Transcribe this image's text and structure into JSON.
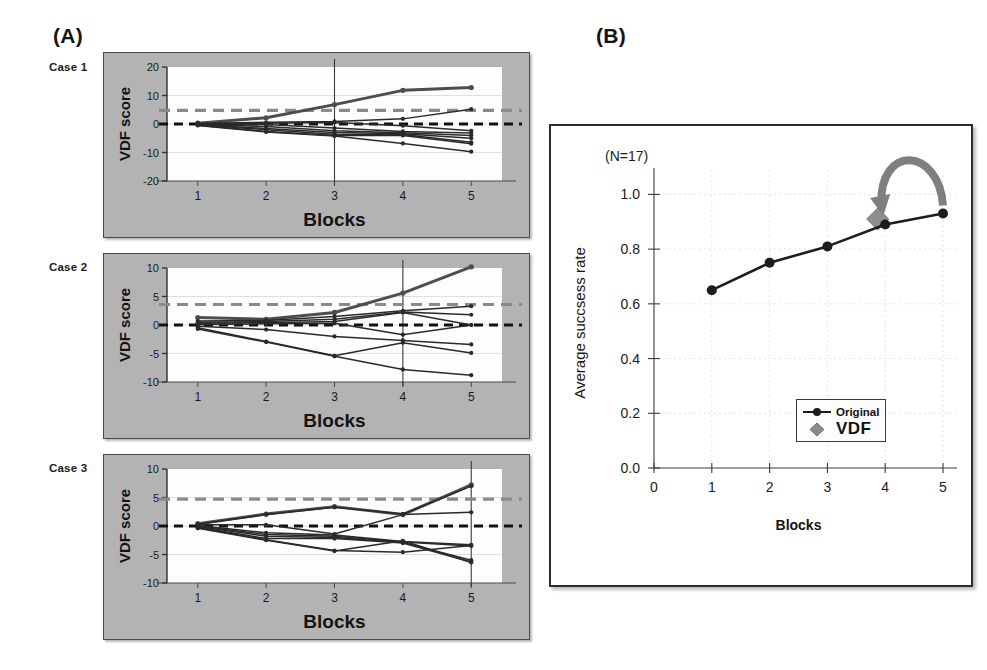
{
  "figure": {
    "panelA_letter": "(A)",
    "panelB_letter": "(B)"
  },
  "panelA": {
    "cases": [
      {
        "label": "Case 1",
        "ylabel": "VDF score",
        "xlabel": "Blocks",
        "yticks": [
          "20",
          "10",
          "0",
          "-10",
          "-20"
        ],
        "xticks": [
          "1",
          "2",
          "3",
          "4",
          "5"
        ]
      },
      {
        "label": "Case 2",
        "ylabel": "VDF score",
        "xlabel": "Blocks",
        "yticks": [
          "10",
          "5",
          "0",
          "-5",
          "-10"
        ],
        "xticks": [
          "1",
          "2",
          "3",
          "4",
          "5"
        ]
      },
      {
        "label": "Case 3",
        "ylabel": "VDF score",
        "xlabel": "Blocks",
        "yticks": [
          "10",
          "5",
          "0",
          "-5",
          "-10"
        ],
        "xticks": [
          "1",
          "2",
          "3",
          "4",
          "5"
        ]
      }
    ]
  },
  "panelB": {
    "annotation": "(N=17)",
    "ylabel": "Average succsess rate",
    "xlabel": "Blocks",
    "yticks": [
      "1.0",
      "0.8",
      "0.6",
      "0.4",
      "0.2",
      "0.0"
    ],
    "xticks": [
      "0",
      "1",
      "2",
      "3",
      "4",
      "5"
    ],
    "legend": [
      {
        "label": "Original",
        "marker": "line-circle-marker",
        "color": "#1d1d1d"
      },
      {
        "label": "VDF",
        "marker": "diamond-marker",
        "color": "#8a8a8a"
      }
    ],
    "arrow_name": "curved-transfer-arrow"
  },
  "colors": {
    "panel_bg_gray": "#b3b3b3",
    "plot_bg": "#ffffff",
    "line_dark": "#1d1d1d",
    "threshold_dashed_gray": "#8a8a8a",
    "zero_dashed_black": "#111111",
    "vdf_diamond_gray": "#8a8a8a",
    "arrow_gray": "#7f7f7f"
  },
  "chart_data": [
    {
      "id": "case1",
      "type": "line",
      "title": "Case 1",
      "xlabel": "Blocks",
      "ylabel": "VDF score",
      "x": [
        1,
        2,
        3,
        4,
        5
      ],
      "xlim": [
        0.55,
        5.45
      ],
      "ylim": [
        -20,
        20
      ],
      "yticks": [
        20,
        10,
        0,
        -10,
        -20
      ],
      "grid": true,
      "threshold_line": 4.8,
      "zero_line": 0,
      "marker_block": 3,
      "series": [
        {
          "name": "s1",
          "values": [
            0.3,
            2.2,
            6.8,
            11.8,
            12.8
          ]
        },
        {
          "name": "s2",
          "values": [
            0.2,
            0.6,
            0.9,
            1.8,
            5.2
          ]
        },
        {
          "name": "s3",
          "values": [
            0.1,
            0.3,
            0.5,
            -0.6,
            -2.4
          ]
        },
        {
          "name": "s4",
          "values": [
            0.0,
            -0.2,
            -1.4,
            -2.6,
            -3.2
          ]
        },
        {
          "name": "s5",
          "values": [
            -0.1,
            -0.9,
            -2.4,
            -3.1,
            -4.0
          ]
        },
        {
          "name": "s6",
          "values": [
            -0.2,
            -1.6,
            -3.0,
            -3.4,
            -5.0
          ]
        },
        {
          "name": "s7",
          "values": [
            -0.3,
            -2.0,
            -3.6,
            -3.7,
            -6.4
          ]
        },
        {
          "name": "s8",
          "values": [
            -0.4,
            -2.6,
            -4.0,
            -4.0,
            -6.9
          ]
        },
        {
          "name": "s9",
          "values": [
            -0.5,
            -2.8,
            -4.2,
            -6.8,
            -9.7
          ]
        }
      ]
    },
    {
      "id": "case2",
      "type": "line",
      "title": "Case 2",
      "xlabel": "Blocks",
      "ylabel": "VDF score",
      "x": [
        1,
        2,
        3,
        4,
        5
      ],
      "xlim": [
        0.55,
        5.45
      ],
      "ylim": [
        -10,
        10
      ],
      "yticks": [
        10,
        5,
        0,
        -5,
        -10
      ],
      "grid": true,
      "threshold_line": 3.6,
      "zero_line": 0,
      "marker_block": 4,
      "series": [
        {
          "name": "s1",
          "values": [
            1.3,
            1.0,
            2.2,
            5.6,
            10.2
          ]
        },
        {
          "name": "s2",
          "values": [
            0.7,
            0.8,
            1.5,
            2.5,
            3.3
          ]
        },
        {
          "name": "s3",
          "values": [
            0.5,
            0.6,
            1.0,
            2.3,
            1.8
          ]
        },
        {
          "name": "s4",
          "values": [
            0.3,
            0.4,
            0.6,
            2.2,
            0.0
          ]
        },
        {
          "name": "s5",
          "values": [
            0.1,
            0.2,
            0.3,
            -1.7,
            0.0
          ]
        },
        {
          "name": "s6",
          "values": [
            -0.2,
            -0.8,
            -2.0,
            -2.7,
            -3.4
          ]
        },
        {
          "name": "s7",
          "values": [
            -0.5,
            -2.9,
            -5.4,
            -3.1,
            -4.9
          ]
        },
        {
          "name": "s8",
          "values": [
            -0.7,
            -3.0,
            -5.5,
            -7.8,
            -8.8
          ]
        }
      ]
    },
    {
      "id": "case3",
      "type": "line",
      "title": "Case 3",
      "xlabel": "Blocks",
      "ylabel": "VDF score",
      "x": [
        1,
        2,
        3,
        4,
        5
      ],
      "xlim": [
        0.55,
        5.45
      ],
      "ylim": [
        -10,
        10
      ],
      "yticks": [
        10,
        5,
        0,
        -5,
        -10
      ],
      "grid": true,
      "threshold_line": 4.7,
      "zero_line": 0,
      "marker_block": 5,
      "series": [
        {
          "name": "s1",
          "values": [
            0.4,
            2.1,
            3.4,
            2.0,
            7.2
          ]
        },
        {
          "name": "s2",
          "values": [
            0.3,
            2.0,
            3.3,
            2.1,
            7.0
          ]
        },
        {
          "name": "s3",
          "values": [
            0.2,
            0.2,
            -1.4,
            2.0,
            2.4
          ]
        },
        {
          "name": "s4",
          "values": [
            0.1,
            -1.2,
            -1.6,
            -2.7,
            -3.3
          ]
        },
        {
          "name": "s5",
          "values": [
            0.0,
            -1.5,
            -1.8,
            -2.8,
            -3.5
          ]
        },
        {
          "name": "s6",
          "values": [
            -0.1,
            -1.8,
            -2.0,
            -2.9,
            -6.0
          ]
        },
        {
          "name": "s7",
          "values": [
            -0.2,
            -2.2,
            -2.2,
            -3.0,
            -6.3
          ]
        },
        {
          "name": "s8",
          "values": [
            -0.3,
            -2.4,
            -4.3,
            -4.6,
            -3.4
          ]
        },
        {
          "name": "s9",
          "values": [
            -0.4,
            -2.5,
            -4.4,
            -2.6,
            -6.4
          ]
        }
      ]
    },
    {
      "id": "panelB",
      "type": "line",
      "title": "(N=17)",
      "xlabel": "Blocks",
      "ylabel": "Average succsess rate",
      "x": [
        1,
        2,
        3,
        4,
        5
      ],
      "xlim": [
        0,
        5
      ],
      "ylim": [
        0.0,
        1.06
      ],
      "yticks": [
        1.0,
        0.8,
        0.6,
        0.4,
        0.2,
        0.0
      ],
      "xticks": [
        0,
        1,
        2,
        3,
        4,
        5
      ],
      "grid": true,
      "series": [
        {
          "name": "Original",
          "values": [
            0.65,
            0.75,
            0.81,
            0.89,
            0.93
          ]
        }
      ],
      "vdf_point": {
        "x": 3.87,
        "y": 0.91,
        "name": "VDF"
      },
      "legend_position": "center-right"
    }
  ]
}
